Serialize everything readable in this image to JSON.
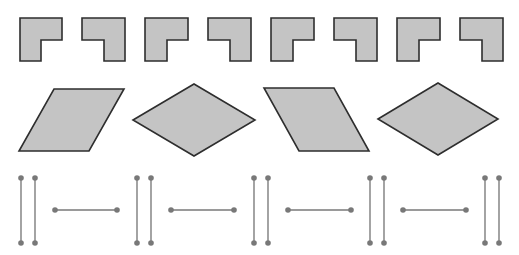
{
  "colors": {
    "fill": "#c4c4c4",
    "stroke": "#2e2e2e",
    "segment_line": "#9a9a9a",
    "segment_dot": "#787878",
    "background": "#ffffff"
  },
  "rows": {
    "l_shapes": [
      {
        "orientation": "notch-bottom-right",
        "x": 20,
        "y": 18,
        "w": 42,
        "h": 43
      },
      {
        "orientation": "notch-bottom-left",
        "x": 82,
        "y": 18,
        "w": 43,
        "h": 43
      },
      {
        "orientation": "notch-bottom-right",
        "x": 145,
        "y": 18,
        "w": 43,
        "h": 43
      },
      {
        "orientation": "notch-bottom-left",
        "x": 208,
        "y": 18,
        "w": 43,
        "h": 43
      },
      {
        "orientation": "notch-bottom-right",
        "x": 271,
        "y": 18,
        "w": 43,
        "h": 43
      },
      {
        "orientation": "notch-bottom-left",
        "x": 334,
        "y": 18,
        "w": 43,
        "h": 43
      },
      {
        "orientation": "notch-bottom-right",
        "x": 397,
        "y": 18,
        "w": 43,
        "h": 43
      },
      {
        "orientation": "notch-bottom-left",
        "x": 460,
        "y": 18,
        "w": 43,
        "h": 43
      }
    ],
    "quads": [
      {
        "kind": "parallelogram-right-lean",
        "points": "54,89 124,89 89,151 19,151"
      },
      {
        "kind": "rhombus",
        "points": "133,120 194,84 255,120 194,156"
      },
      {
        "kind": "parallelogram-left-lean",
        "points": "264,88 334,88 369,151 299,151"
      },
      {
        "kind": "rhombus",
        "points": "378,119 438,83 498,119 438,155"
      }
    ],
    "segments": [
      {
        "kind": "vertical",
        "x1": 21,
        "y1": 178,
        "x2": 21,
        "y2": 243
      },
      {
        "kind": "vertical",
        "x1": 35,
        "y1": 178,
        "x2": 35,
        "y2": 243
      },
      {
        "kind": "horizontal",
        "x1": 55,
        "y1": 210,
        "x2": 117,
        "y2": 210
      },
      {
        "kind": "vertical",
        "x1": 137,
        "y1": 178,
        "x2": 137,
        "y2": 243
      },
      {
        "kind": "vertical",
        "x1": 151,
        "y1": 178,
        "x2": 151,
        "y2": 243
      },
      {
        "kind": "horizontal",
        "x1": 171,
        "y1": 210,
        "x2": 234,
        "y2": 210
      },
      {
        "kind": "vertical",
        "x1": 254,
        "y1": 178,
        "x2": 254,
        "y2": 243
      },
      {
        "kind": "vertical",
        "x1": 268,
        "y1": 178,
        "x2": 268,
        "y2": 243
      },
      {
        "kind": "horizontal",
        "x1": 288,
        "y1": 210,
        "x2": 351,
        "y2": 210
      },
      {
        "kind": "vertical",
        "x1": 370,
        "y1": 178,
        "x2": 370,
        "y2": 243
      },
      {
        "kind": "vertical",
        "x1": 384,
        "y1": 178,
        "x2": 384,
        "y2": 243
      },
      {
        "kind": "horizontal",
        "x1": 403,
        "y1": 210,
        "x2": 466,
        "y2": 210
      },
      {
        "kind": "vertical",
        "x1": 485,
        "y1": 178,
        "x2": 485,
        "y2": 243
      },
      {
        "kind": "vertical",
        "x1": 499,
        "y1": 178,
        "x2": 499,
        "y2": 243
      }
    ]
  }
}
